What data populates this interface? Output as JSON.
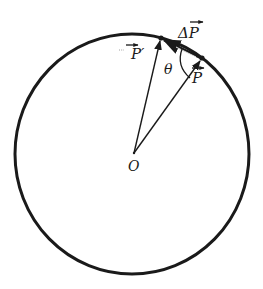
{
  "diagram": {
    "labels": {
      "p_prime": "P′",
      "p": "P",
      "delta_p": "ΔP",
      "theta": "θ",
      "origin": "O"
    },
    "colors": {
      "stroke": "#1a1a1a",
      "background": "#ffffff"
    },
    "geometry": {
      "circle": {
        "cx": 132,
        "cy": 154,
        "rx": 117,
        "ry": 120
      },
      "origin": [
        134,
        153
      ],
      "p_prime_tip": [
        161,
        38
      ],
      "p_tip": [
        202,
        58
      ]
    }
  }
}
